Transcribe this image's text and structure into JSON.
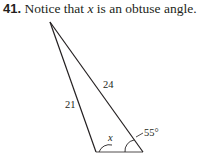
{
  "problem": {
    "number": "41.",
    "text_before": "Notice that",
    "variable": "x",
    "text_after": "is an obtuse angle."
  },
  "figure": {
    "side_left_label": "21",
    "side_right_label": "24",
    "angle_x_label": "x",
    "angle_given_label": "55°"
  }
}
